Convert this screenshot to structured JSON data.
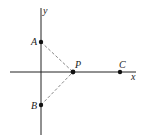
{
  "diagram": {
    "axes": {
      "x_label": "x",
      "y_label": "y"
    },
    "points": [
      {
        "name": "A",
        "x": 41,
        "y": 42
      },
      {
        "name": "B",
        "x": 41,
        "y": 105
      },
      {
        "name": "P",
        "x": 73,
        "y": 72
      },
      {
        "name": "C",
        "x": 120,
        "y": 72
      }
    ],
    "segments": [
      {
        "from": "A",
        "to": "P",
        "style": "dashed"
      },
      {
        "from": "B",
        "to": "P",
        "style": "dashed"
      }
    ],
    "colors": {
      "line": "#222222",
      "dashed": "#888888"
    }
  }
}
